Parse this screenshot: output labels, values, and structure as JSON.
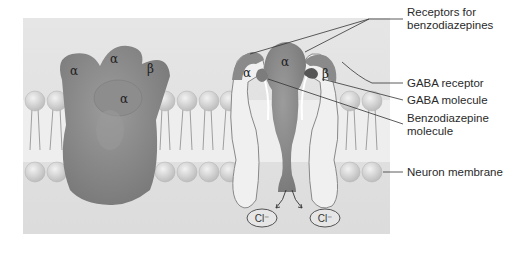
{
  "figure": {
    "left_receptor": {
      "subunits": [
        "α",
        "α",
        "β",
        "α"
      ]
    },
    "right_receptor": {
      "subunits": [
        "α",
        "α",
        "β"
      ]
    },
    "ions": [
      "Cl⁻",
      "Cl⁻"
    ],
    "labels": {
      "receptors_benzo_line1": "Receptors for",
      "receptors_benzo_line2": "benzodiazepines",
      "gaba_receptor": "GABA receptor",
      "gaba_molecule": "GABA molecule",
      "benzo_line1": "Benzodiazepine",
      "benzo_line2": "molecule",
      "neuron_membrane": "Neuron membrane"
    },
    "colors": {
      "panel": "#e4e4e4",
      "protein": "#8a8a8a",
      "protein_dark": "#6e6e6e",
      "channel_fill": "#ececec",
      "lipid_head": "#d2d2d2",
      "leader_line": "#333333"
    }
  }
}
